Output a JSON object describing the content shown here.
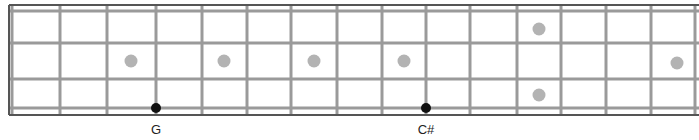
{
  "fretboard": {
    "nut_x": 12,
    "board_left": 9,
    "board_right": 699,
    "board_top": 5,
    "board_bottom": 115,
    "fret_x": [
      12,
      60,
      107,
      156,
      202,
      247,
      291,
      337,
      382,
      426,
      470,
      517,
      561,
      606,
      651,
      695
    ],
    "string_y": [
      11,
      43,
      79,
      108
    ],
    "colors": {
      "border": "#555555",
      "fret": "#9a9a9a",
      "string": "#9a9a9a",
      "inlay": "#b3b3b3",
      "note": "#111111"
    },
    "inlays": [
      {
        "x": 131,
        "y": 61,
        "fret": 3
      },
      {
        "x": 224,
        "y": 61,
        "fret": 5
      },
      {
        "x": 314,
        "y": 61,
        "fret": 7
      },
      {
        "x": 404,
        "y": 61,
        "fret": 9
      },
      {
        "x": 539,
        "y": 29,
        "fret": 12
      },
      {
        "x": 539,
        "y": 95,
        "fret": 12
      },
      {
        "x": 677,
        "y": 63,
        "fret": 15
      }
    ],
    "notes": [
      {
        "x": 156,
        "y": 108,
        "label": "G",
        "label_y": 122
      },
      {
        "x": 426,
        "y": 108,
        "label": "C#",
        "label_y": 122
      }
    ]
  }
}
